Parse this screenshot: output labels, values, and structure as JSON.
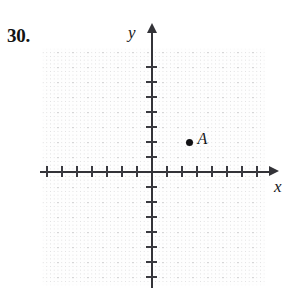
{
  "problem": {
    "number": "30."
  },
  "figure": {
    "kind": "cartesian-coordinate-plane",
    "background_color": "#ffffff",
    "axis_color": "#333338",
    "grid_color": "#96969b",
    "point_color": "#111114"
  },
  "axes": {
    "x_label": "x",
    "y_label": "y",
    "x_arrow": "right-arrow",
    "y_arrow": "up-arrow",
    "origin_px": {
      "x": 152,
      "y": 172
    },
    "tick_spacing_px": 15,
    "ticks_x_negative": 7,
    "ticks_x_positive": 7,
    "ticks_y_negative": 7,
    "ticks_y_positive": 7
  },
  "chart_data": {
    "type": "scatter",
    "title": "",
    "xlabel": "x",
    "ylabel": "y",
    "grid": true,
    "legend": "none",
    "xlim": [
      -7,
      7
    ],
    "ylim": [
      -7,
      7
    ],
    "xticks": [
      -7,
      -6,
      -5,
      -4,
      -3,
      -2,
      -1,
      1,
      2,
      3,
      4,
      5,
      6,
      7
    ],
    "yticks": [
      -7,
      -6,
      -5,
      -4,
      -3,
      -2,
      -1,
      1,
      2,
      3,
      4,
      5,
      6,
      7
    ],
    "xticklabels": [],
    "yticklabels": [],
    "points": [
      {
        "label": "A",
        "x": 2.5,
        "y": 2
      }
    ]
  }
}
